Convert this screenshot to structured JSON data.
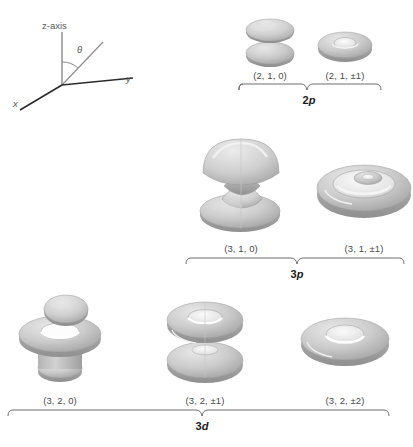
{
  "figure": {
    "background_color": "#ffffff",
    "orbital_fill": "#c9c9c9",
    "orbital_highlight": "#eeeeee",
    "orbital_shadow": "#9a9a9a",
    "label_color": "#4a4a4a"
  },
  "axes": {
    "z_label": "z-axis",
    "x_label": "x",
    "y_label": "y",
    "theta_label": "θ"
  },
  "groups": [
    {
      "id": "2p",
      "shell_label_n": "2",
      "shell_label_l": "p",
      "orbitals": [
        {
          "id": "2-1-0",
          "label": "(2, 1, 0)",
          "shape": "double-lobe"
        },
        {
          "id": "2-1-pm1",
          "label": "(2, 1, ±1)",
          "shape": "torus"
        }
      ]
    },
    {
      "id": "3p",
      "shell_label_n": "3",
      "shell_label_l": "p",
      "orbitals": [
        {
          "id": "3-1-0",
          "label": "(3, 1, 0)",
          "shape": "mushroom-stack"
        },
        {
          "id": "3-1-pm1",
          "label": "(3, 1, ±1)",
          "shape": "nested-torus"
        }
      ]
    },
    {
      "id": "3d",
      "shell_label_n": "3",
      "shell_label_l": "d",
      "orbitals": [
        {
          "id": "3-2-0",
          "label": "(3, 2, 0)",
          "shape": "lobe-torus-lobe"
        },
        {
          "id": "3-2-pm1",
          "label": "(3, 2, ±1)",
          "shape": "double-torus"
        },
        {
          "id": "3-2-pm2",
          "label": "(3, 2, ±2)",
          "shape": "flat-torus"
        }
      ]
    }
  ]
}
